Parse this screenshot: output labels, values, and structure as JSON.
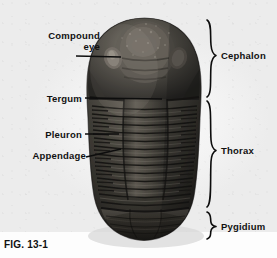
{
  "figure": {
    "caption": "FIG. 13-1",
    "background_color": "#fdfdfd",
    "text_color": "#111111"
  },
  "callout_labels": [
    {
      "id": "compound-eye",
      "text_line1": "Compound",
      "text_line2": "eye",
      "side": "left",
      "text_x": 100,
      "text_y": 36,
      "leader": {
        "x1": 76,
        "y1": 56,
        "x2": 121,
        "y2": 57
      }
    },
    {
      "id": "tergum",
      "text_line1": "Tergum",
      "text_line2": "",
      "side": "left",
      "text_x": 82,
      "text_y": 94,
      "leader": {
        "x1": 85,
        "y1": 98,
        "x2": 162,
        "y2": 99
      }
    },
    {
      "id": "pleuron",
      "text_line1": "Pleuron",
      "text_line2": "",
      "side": "left",
      "text_x": 82,
      "text_y": 130,
      "leader": {
        "x1": 85,
        "y1": 134,
        "x2": 119,
        "y2": 134
      }
    },
    {
      "id": "appendage",
      "text_line1": "Appendage",
      "text_line2": "",
      "side": "left",
      "text_x": 86,
      "text_y": 151,
      "leader": {
        "x1": 86,
        "y1": 157,
        "x2": 121,
        "y2": 149
      }
    }
  ],
  "region_labels": [
    {
      "id": "cephalon",
      "text": "Cephalon",
      "text_x": 221,
      "text_y": 55,
      "brace_top": 19,
      "brace_bottom": 98
    },
    {
      "id": "thorax",
      "text": "Thorax",
      "text_x": 221,
      "text_y": 150,
      "brace_top": 100,
      "brace_bottom": 209
    },
    {
      "id": "pygidium",
      "text": "Pygidium",
      "text_x": 221,
      "text_y": 226,
      "brace_top": 211,
      "brace_bottom": 241
    }
  ],
  "specimen": {
    "name": "trilobite-body",
    "outline": {
      "left": 88,
      "top": 18,
      "right": 201,
      "bottom": 241
    },
    "parts": [
      {
        "name": "cephalon-dome",
        "top": 18,
        "bottom": 98
      },
      {
        "name": "left-compound-eye",
        "x": 113,
        "y": 58
      },
      {
        "name": "right-compound-eye",
        "x": 179,
        "y": 58
      },
      {
        "name": "axial-lobe",
        "top": 98,
        "bottom": 210
      },
      {
        "name": "thoracic-segments",
        "count": 13,
        "top": 100,
        "bottom": 208
      },
      {
        "name": "pygidium-shield",
        "top": 210,
        "bottom": 241
      }
    ],
    "colors": {
      "shell_dark": "#2b2a28",
      "shell_mid": "#46443f",
      "shell_light": "#6e6a62",
      "shell_highlight": "#8d8880",
      "shadow": "#171614"
    }
  }
}
